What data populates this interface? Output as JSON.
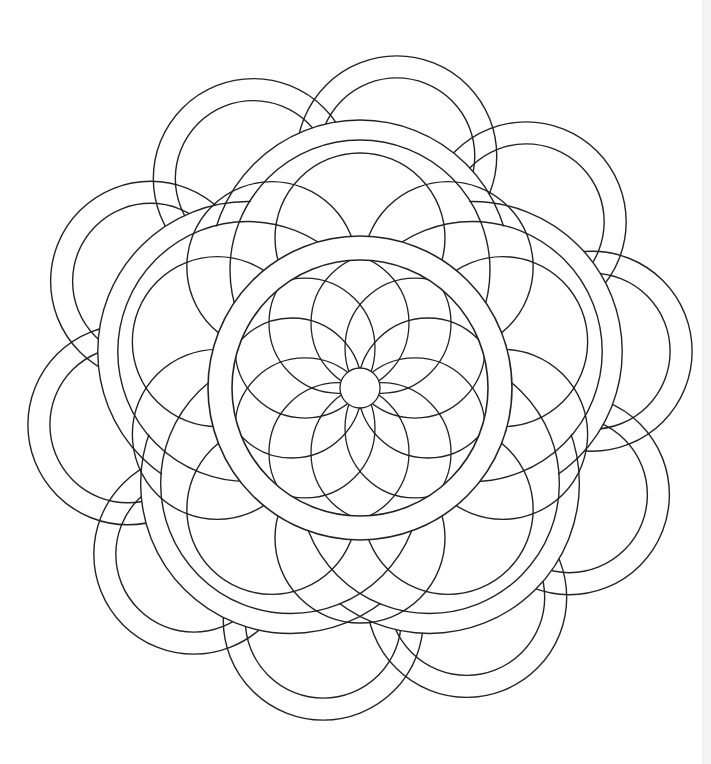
{
  "artwork": {
    "center": [
      360,
      388
    ],
    "stroke_color": "#222222",
    "background_color": "#ffffff",
    "edge_strip_color": "#f3f3f3",
    "outer_petals": {
      "count": 10,
      "ring_radius": 235,
      "outer_r": 100,
      "inner_r": 78
    },
    "scallop_band": {
      "count": 5,
      "lobe_distance": 118,
      "outer_r": 150,
      "inner_r": 130
    },
    "mid_circles": {
      "count": 10,
      "distance": 150,
      "r": 85
    },
    "central_ring": {
      "outer_r": 152,
      "inner_r": 128
    },
    "inner_petals": {
      "count": 10,
      "distance": 68,
      "r": 70
    },
    "core_circle_r": 20
  }
}
